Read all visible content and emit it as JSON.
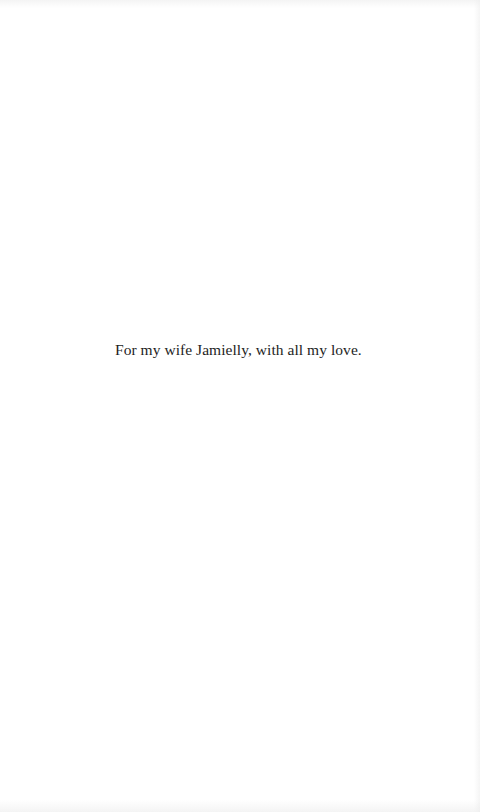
{
  "page": {
    "dedication": "For my wife Jamielly, with all my love.",
    "colors": {
      "background": "#ffffff",
      "text": "#1e1e1e"
    }
  }
}
